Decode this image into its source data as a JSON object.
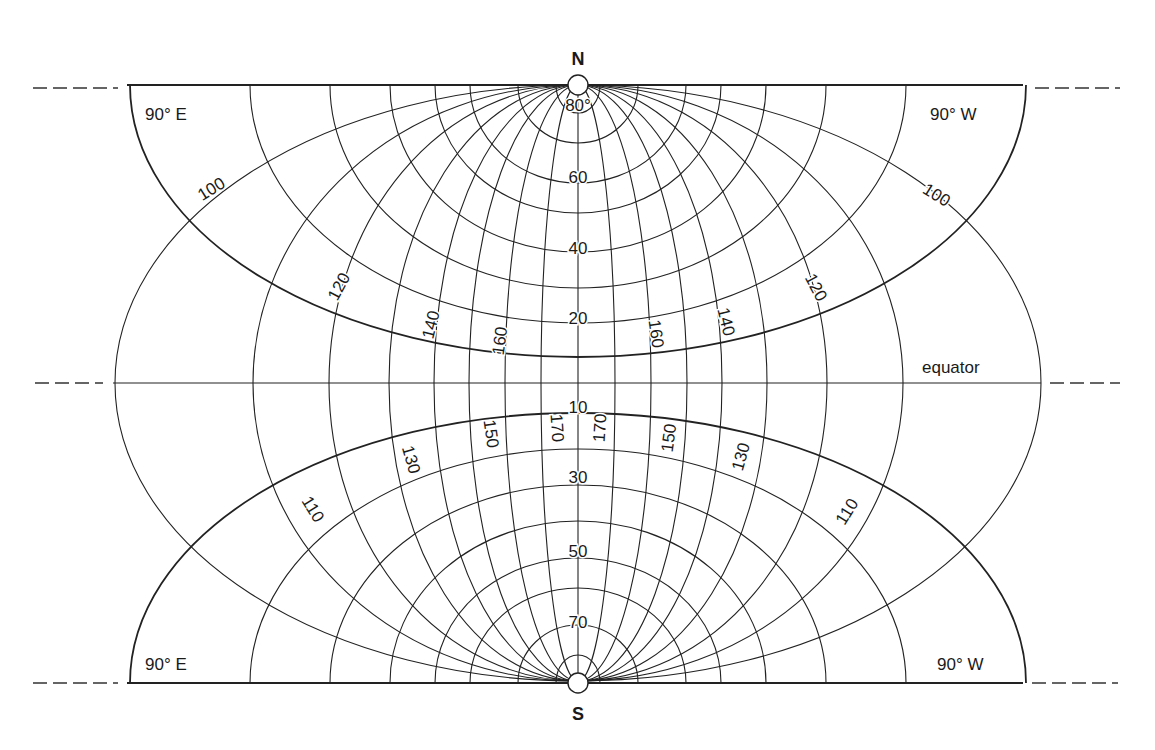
{
  "figure": {
    "type": "conformal world projection graticule (two polar lattices)",
    "colors": {
      "line": "#222222",
      "text": "#1a1a1a",
      "background": "#ffffff"
    }
  },
  "geometry": {
    "north_pole": {
      "x": 578,
      "y": 85,
      "r": 10
    },
    "south_pole": {
      "x": 578,
      "y": 683,
      "r": 10
    },
    "equator_y": 383,
    "top_line": {
      "x1": 127,
      "x2": 1023,
      "y": 85
    },
    "bottom_line": {
      "x1": 127,
      "x2": 1023,
      "y": 683
    },
    "equator_line": {
      "x1": 113,
      "x2": 1041,
      "y": 383
    },
    "dashes": [
      {
        "x1": 33,
        "x2": 118,
        "y": 88
      },
      {
        "x1": 1035,
        "x2": 1120,
        "y": 88
      },
      {
        "x1": 35,
        "x2": 103,
        "y": 383
      },
      {
        "x1": 1050,
        "x2": 1120,
        "y": 383
      },
      {
        "x1": 33,
        "x2": 118,
        "y": 683
      },
      {
        "x1": 1032,
        "x2": 1118,
        "y": 683
      }
    ],
    "meridian_semi_axes_a": [
      37,
      73,
      109,
      144,
      189,
      249,
      325,
      463
    ],
    "meridian_semi_axis_b": 298,
    "parallels_north": [
      {
        "a": 22,
        "b": 28
      },
      {
        "a": 60,
        "b": 58
      },
      {
        "a": 108,
        "b": 98
      },
      {
        "a": 143,
        "b": 128
      },
      {
        "a": 188,
        "b": 167
      },
      {
        "a": 248,
        "b": 203
      },
      {
        "a": 328,
        "b": 238
      },
      {
        "a": 448,
        "b": 272,
        "heavy": true
      }
    ],
    "parallels_south": [
      {
        "a": 22,
        "b": 28
      },
      {
        "a": 60,
        "b": 58
      },
      {
        "a": 108,
        "b": 95
      },
      {
        "a": 143,
        "b": 125
      },
      {
        "a": 188,
        "b": 162
      },
      {
        "a": 248,
        "b": 198
      },
      {
        "a": 328,
        "b": 234
      },
      {
        "a": 448,
        "b": 270,
        "heavy": true
      }
    ]
  },
  "labels": {
    "north": "N",
    "south": "S",
    "equator": "equator",
    "corner_top_left": "90° E",
    "corner_top_right": "90° W",
    "corner_bottom_left": "90° E",
    "corner_bottom_right": "90° W",
    "parallels_upper": [
      {
        "text": "80°",
        "x": 578,
        "y": 107
      },
      {
        "text": "60",
        "x": 578,
        "y": 179
      },
      {
        "text": "40",
        "x": 578,
        "y": 250
      },
      {
        "text": "20",
        "x": 578,
        "y": 320
      }
    ],
    "parallels_lower": [
      {
        "text": "10",
        "x": 578,
        "y": 409
      },
      {
        "text": "30",
        "x": 578,
        "y": 479
      },
      {
        "text": "50",
        "x": 578,
        "y": 553
      },
      {
        "text": "70",
        "x": 578,
        "y": 624
      }
    ],
    "meridians_upper": [
      {
        "text": "100",
        "x": 212,
        "y": 190,
        "rot": -32
      },
      {
        "text": "120",
        "x": 340,
        "y": 287,
        "rot": -62
      },
      {
        "text": "140",
        "x": 432,
        "y": 325,
        "rot": -76
      },
      {
        "text": "160",
        "x": 501,
        "y": 341,
        "rot": -82
      },
      {
        "text": "160",
        "x": 655,
        "y": 334,
        "rot": 82
      },
      {
        "text": "140",
        "x": 725,
        "y": 322,
        "rot": 76
      },
      {
        "text": "120",
        "x": 815,
        "y": 288,
        "rot": 62
      },
      {
        "text": "100",
        "x": 936,
        "y": 196,
        "rot": 32
      }
    ],
    "meridians_lower": [
      {
        "text": "110",
        "x": 312,
        "y": 510,
        "rot": 58
      },
      {
        "text": "130",
        "x": 410,
        "y": 460,
        "rot": 74
      },
      {
        "text": "150",
        "x": 490,
        "y": 434,
        "rot": 82
      },
      {
        "text": "170",
        "x": 556,
        "y": 428,
        "rot": 86
      },
      {
        "text": "170",
        "x": 601,
        "y": 428,
        "rot": -86
      },
      {
        "text": "150",
        "x": 670,
        "y": 438,
        "rot": -82
      },
      {
        "text": "130",
        "x": 742,
        "y": 457,
        "rot": -74
      },
      {
        "text": "110",
        "x": 848,
        "y": 512,
        "rot": -58
      }
    ]
  }
}
